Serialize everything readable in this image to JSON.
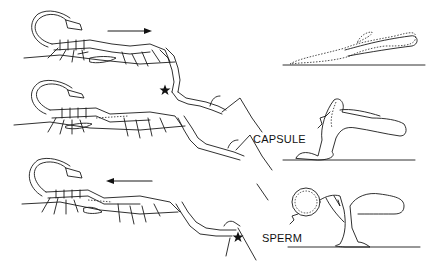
{
  "figure": {
    "panels": [
      {
        "id": "row1",
        "direction_arrow": "right",
        "description": "pair moving forward"
      },
      {
        "id": "row2",
        "direction_arrow": null,
        "description": "male deposits spermatophore, star marks position"
      },
      {
        "id": "row3",
        "direction_arrow": "left",
        "description": "pair moving back over spermatophore"
      }
    ],
    "labels": {
      "capsule": "CAPSULE",
      "sperm": "SPERM"
    },
    "markers": {
      "star_icon": "★",
      "star_color": "#111111"
    },
    "colors": {
      "background": "#ffffff",
      "line": "#1a1a1a"
    }
  }
}
